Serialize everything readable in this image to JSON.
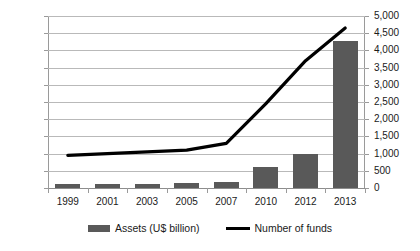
{
  "chart_data": {
    "type": "bar",
    "title": "",
    "xlabel": "",
    "ylabel": "",
    "grid": true,
    "legend_position": "bottom",
    "categories": [
      "1999",
      "2001",
      "2003",
      "2005",
      "2007",
      "2010",
      "2012",
      "2013"
    ],
    "axes": {
      "left": {
        "label": "Assets (U$ billion)",
        "ylim": [
          0,
          1000
        ],
        "step": 100,
        "ticks": [
          "0",
          "100",
          "200",
          "300",
          "400",
          "500",
          "600",
          "700",
          "800",
          "900",
          "1000"
        ]
      },
      "right": {
        "label": "Number of funds",
        "ylim": [
          0,
          5000
        ],
        "step": 500,
        "ticks": [
          "0",
          "500",
          "1,000",
          "1,500",
          "2,000",
          "2,500",
          "3,000",
          "3,500",
          "4,000",
          "4,500",
          "5,000"
        ]
      }
    },
    "series": [
      {
        "name": "Assets (U$ billion)",
        "type": "bar",
        "axis": "left",
        "color": "#595959",
        "values": [
          25,
          22,
          26,
          32,
          37,
          122,
          195,
          855
        ]
      },
      {
        "name": "Number of funds",
        "type": "line",
        "axis": "right",
        "color": "#000000",
        "values": [
          950,
          1000,
          1050,
          1100,
          1300,
          2450,
          3700,
          4650
        ]
      }
    ]
  },
  "legend": {
    "items": [
      {
        "label": "Assets (U$ billion)",
        "marker": "bar-swatch",
        "color": "#595959"
      },
      {
        "label": "Number of funds",
        "marker": "line-swatch",
        "color": "#000000"
      }
    ]
  }
}
